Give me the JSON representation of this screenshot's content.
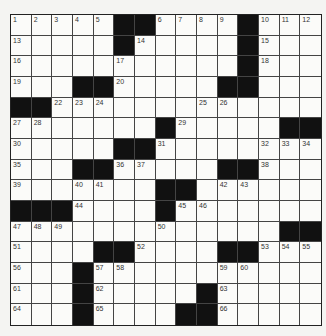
{
  "puzzle": {
    "size": 15,
    "colors": {
      "black": "#111111",
      "white": "#fbfbf9",
      "grid_line": "#444444"
    },
    "rows": [
      ".....##....#...",
      ".....#.....#...",
      "...........#...",
      "...##.....##...",
      "##.............",
      ".......#.....###",
      ".....##........",
      "...##.....##...",
      ".......##......",
      "###....#.......",
      ".............##",
      "....##....##...",
      "...#...........",
      "...#.....#.....",
      "...#....##....."
    ],
    "numbers": [
      {
        "r": 0,
        "c": 0,
        "n": "1"
      },
      {
        "r": 0,
        "c": 1,
        "n": "2"
      },
      {
        "r": 0,
        "c": 2,
        "n": "3"
      },
      {
        "r": 0,
        "c": 3,
        "n": "4"
      },
      {
        "r": 0,
        "c": 4,
        "n": "5"
      },
      {
        "r": 0,
        "c": 7,
        "n": "6"
      },
      {
        "r": 0,
        "c": 8,
        "n": "7"
      },
      {
        "r": 0,
        "c": 9,
        "n": "8"
      },
      {
        "r": 0,
        "c": 10,
        "n": "9"
      },
      {
        "r": 0,
        "c": 12,
        "n": "10"
      },
      {
        "r": 0,
        "c": 13,
        "n": "11"
      },
      {
        "r": 0,
        "c": 14,
        "n": "12"
      },
      {
        "r": 1,
        "c": 0,
        "n": "13"
      },
      {
        "r": 1,
        "c": 6,
        "n": "14"
      },
      {
        "r": 1,
        "c": 12,
        "n": "15"
      },
      {
        "r": 2,
        "c": 0,
        "n": "16"
      },
      {
        "r": 2,
        "c": 5,
        "n": "17"
      },
      {
        "r": 2,
        "c": 12,
        "n": "18"
      },
      {
        "r": 3,
        "c": 0,
        "n": "19"
      },
      {
        "r": 3,
        "c": 5,
        "n": "20"
      },
      {
        "r": 3,
        "c": 11,
        "n": "21"
      },
      {
        "r": 4,
        "c": 2,
        "n": "22"
      },
      {
        "r": 4,
        "c": 3,
        "n": "23"
      },
      {
        "r": 4,
        "c": 4,
        "n": "24"
      },
      {
        "r": 4,
        "c": 9,
        "n": "25"
      },
      {
        "r": 4,
        "c": 10,
        "n": "26"
      },
      {
        "r": 5,
        "c": 0,
        "n": "27"
      },
      {
        "r": 5,
        "c": 1,
        "n": "28"
      },
      {
        "r": 5,
        "c": 8,
        "n": "29"
      },
      {
        "r": 6,
        "c": 0,
        "n": "30"
      },
      {
        "r": 6,
        "c": 7,
        "n": "31"
      },
      {
        "r": 6,
        "c": 12,
        "n": "32"
      },
      {
        "r": 6,
        "c": 13,
        "n": "33"
      },
      {
        "r": 6,
        "c": 14,
        "n": "34"
      },
      {
        "r": 7,
        "c": 0,
        "n": "35"
      },
      {
        "r": 7,
        "c": 5,
        "n": "36"
      },
      {
        "r": 7,
        "c": 6,
        "n": "37"
      },
      {
        "r": 7,
        "c": 12,
        "n": "38"
      },
      {
        "r": 8,
        "c": 0,
        "n": "39"
      },
      {
        "r": 8,
        "c": 3,
        "n": "40"
      },
      {
        "r": 8,
        "c": 4,
        "n": "41"
      },
      {
        "r": 8,
        "c": 10,
        "n": "42"
      },
      {
        "r": 8,
        "c": 11,
        "n": "43"
      },
      {
        "r": 9,
        "c": 3,
        "n": "44"
      },
      {
        "r": 9,
        "c": 8,
        "n": "45"
      },
      {
        "r": 9,
        "c": 9,
        "n": "46"
      },
      {
        "r": 10,
        "c": 0,
        "n": "47"
      },
      {
        "r": 10,
        "c": 1,
        "n": "48"
      },
      {
        "r": 10,
        "c": 2,
        "n": "49"
      },
      {
        "r": 10,
        "c": 7,
        "n": "50"
      },
      {
        "r": 11,
        "c": 0,
        "n": "51"
      },
      {
        "r": 11,
        "c": 6,
        "n": "52"
      },
      {
        "r": 11,
        "c": 12,
        "n": "53"
      },
      {
        "r": 11,
        "c": 13,
        "n": "54"
      },
      {
        "r": 11,
        "c": 14,
        "n": "55"
      },
      {
        "r": 12,
        "c": 0,
        "n": "56"
      },
      {
        "r": 12,
        "c": 4,
        "n": "57"
      },
      {
        "r": 12,
        "c": 5,
        "n": "58"
      },
      {
        "r": 12,
        "c": 10,
        "n": "59"
      },
      {
        "r": 12,
        "c": 11,
        "n": "60"
      },
      {
        "r": 13,
        "c": 0,
        "n": "61"
      },
      {
        "r": 13,
        "c": 4,
        "n": "62"
      },
      {
        "r": 13,
        "c": 10,
        "n": "63"
      },
      {
        "r": 14,
        "c": 0,
        "n": "64"
      },
      {
        "r": 14,
        "c": 4,
        "n": "65"
      },
      {
        "r": 14,
        "c": 10,
        "n": "66"
      }
    ]
  }
}
